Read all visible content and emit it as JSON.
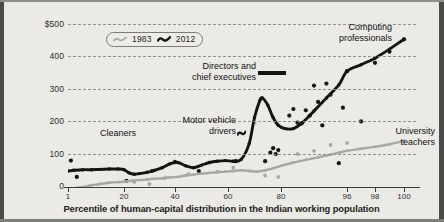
{
  "chart_data": {
    "type": "line",
    "title": "",
    "xlabel": "Percentile of human-capital distribution in the Indian working population",
    "ylabel": "Real weekly wages, 2017 PPP-dollars",
    "xtick_labels": [
      "1",
      "20",
      "40",
      "60",
      "80",
      "96",
      "98",
      "100"
    ],
    "xtick_positions": [
      1,
      20,
      40,
      60,
      80,
      96,
      98,
      100
    ],
    "ytick_labels": [
      "0",
      "100",
      "200",
      "300",
      "400",
      "$500"
    ],
    "ytick_values": [
      0,
      100,
      200,
      300,
      400,
      500
    ],
    "ylim": [
      0,
      520
    ],
    "grid": "horizontal-dashed",
    "legend_position": "top-left-inside",
    "series": [
      {
        "name": "1983",
        "color": "#a8a7a3",
        "x": [
          1,
          3,
          6,
          9,
          12,
          15,
          18,
          20,
          23,
          26,
          29,
          32,
          35,
          38,
          41,
          44,
          47,
          50,
          53,
          56,
          59,
          62,
          65,
          68,
          71,
          74,
          77,
          80,
          83,
          86,
          89,
          92,
          94,
          96,
          97,
          98,
          99,
          100
        ],
        "values": [
          10,
          13,
          17,
          22,
          26,
          30,
          32,
          33,
          36,
          38,
          40,
          42,
          44,
          46,
          48,
          52,
          55,
          58,
          60,
          62,
          64,
          66,
          68,
          66,
          64,
          68,
          74,
          82,
          92,
          100,
          108,
          116,
          122,
          128,
          134,
          140,
          148,
          158
        ]
      },
      {
        "name": "2012",
        "color": "#141414",
        "x": [
          1,
          3,
          6,
          9,
          12,
          15,
          18,
          20,
          22,
          24,
          26,
          29,
          32,
          35,
          38,
          41,
          44,
          47,
          50,
          53,
          56,
          59,
          62,
          65,
          68,
          70,
          72,
          73,
          75,
          77,
          79,
          81,
          83,
          85,
          88,
          91,
          94,
          96,
          97,
          98,
          99,
          100
        ],
        "values": [
          66,
          68,
          70,
          70,
          71,
          72,
          72,
          70,
          60,
          56,
          58,
          62,
          68,
          76,
          88,
          92,
          82,
          76,
          84,
          92,
          96,
          98,
          96,
          102,
          150,
          230,
          282,
          290,
          268,
          230,
          206,
          196,
          196,
          212,
          250,
          290,
          330,
          372,
          392,
          412,
          440,
          470
        ]
      }
    ],
    "scatter_2012": [
      [
        2,
        98
      ],
      [
        4,
        48
      ],
      [
        21,
        36
      ],
      [
        31,
        66
      ],
      [
        40,
        94
      ],
      [
        49,
        66
      ],
      [
        63,
        96
      ],
      [
        74,
        96
      ],
      [
        76,
        122
      ],
      [
        77,
        136
      ],
      [
        78,
        118
      ],
      [
        79,
        130
      ],
      [
        82,
        236
      ],
      [
        83,
        256
      ],
      [
        84,
        214
      ],
      [
        85,
        212
      ],
      [
        86,
        252
      ],
      [
        87,
        236
      ],
      [
        88,
        328
      ],
      [
        89,
        278
      ],
      [
        90,
        206
      ],
      [
        91,
        334
      ],
      [
        92,
        300
      ],
      [
        94,
        90
      ],
      [
        95,
        260
      ],
      [
        96,
        372
      ],
      [
        97,
        218
      ],
      [
        98,
        398
      ],
      [
        99,
        432
      ],
      [
        100,
        470
      ]
    ],
    "scatter_1983": [
      [
        24,
        32
      ],
      [
        30,
        26
      ],
      [
        36,
        44
      ],
      [
        45,
        56
      ],
      [
        56,
        64
      ],
      [
        62,
        76
      ],
      [
        70,
        214
      ],
      [
        74,
        52
      ],
      [
        79,
        48
      ],
      [
        84,
        118
      ],
      [
        88,
        128
      ],
      [
        92,
        146
      ],
      [
        96,
        152
      ]
    ],
    "annotations": [
      {
        "name": "cleaners",
        "text": "Cleaners",
        "x": 96,
        "y": 131,
        "align": "left"
      },
      {
        "name": "motor-vehicle-drivers",
        "text": "Motor vehicle\ndrivers",
        "x": 232,
        "y": 118,
        "align": "right"
      },
      {
        "name": "directors-and-chief-executives",
        "text": "Directors and\nchief executives",
        "x": 252,
        "y": 64,
        "align": "right"
      },
      {
        "name": "computing-professionals",
        "text": "Computing\nprofessionals",
        "x": 388,
        "y": 25,
        "align": "right"
      },
      {
        "name": "university-teachers",
        "text": "University\nteachers",
        "x": 431,
        "y": 129,
        "align": "right"
      }
    ]
  },
  "legend": {
    "items": [
      {
        "label": "1983",
        "color": "#a8a7a3"
      },
      {
        "label": "2012",
        "color": "#141414"
      }
    ]
  },
  "axes": {
    "y_title": "Real weekly wages, 2017 PPP-dollars",
    "x_title": "Percentile of human-capital distribution in the Indian working population"
  }
}
